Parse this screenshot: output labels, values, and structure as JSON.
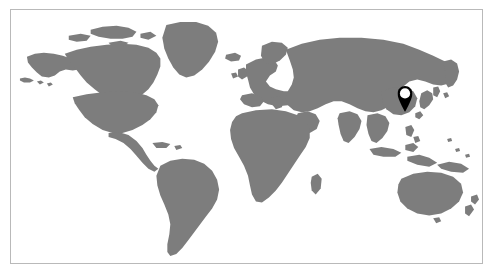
{
  "figure": {
    "kind": "world-map",
    "projection": "robinson",
    "title": "",
    "caption": "",
    "frame": {
      "visible": true,
      "border_color": "#b9b9b9",
      "border_width_px": 1,
      "x": 10,
      "y": 9,
      "width": 473,
      "height": 255
    },
    "colors": {
      "land": "#7d7d7d",
      "ocean": "#ffffff",
      "background": "#ffffff",
      "marker_body": "#000000",
      "marker_center": "#ffffff",
      "frame_border": "#b9b9b9"
    }
  },
  "map": {
    "land_label": "Landmass",
    "ocean_label": "Ocean",
    "graticule_visible": false,
    "labels_visible": false,
    "regions": [
      "North America",
      "Greenland",
      "South America",
      "Europe",
      "Africa",
      "Asia",
      "Australia",
      "New Zealand",
      "Indonesia",
      "Japan",
      "Madagascar",
      "Iceland",
      "British Isles"
    ]
  },
  "markers": [
    {
      "id": "marker-east-asia",
      "label": "",
      "shape": "map-pin",
      "x_pct": 83.6,
      "y_pct": 42.0,
      "width_px": 15,
      "height_px": 26,
      "region": "East Asia",
      "fill": "#000000",
      "center_fill": "#ffffff"
    }
  ],
  "legend": {
    "visible": false,
    "entries": []
  },
  "scale_bar": {
    "visible": false,
    "text": ""
  }
}
